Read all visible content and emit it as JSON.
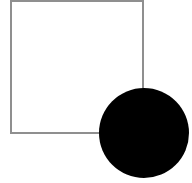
{
  "figure": {
    "name": "square-and-circle-overlap",
    "width": 192,
    "height": 183,
    "background_color": "#ffffff"
  },
  "shapes": {
    "square": {
      "label": "square",
      "x": 11,
      "y": 1,
      "width": 132,
      "height": 132,
      "stroke_color": "#8f8f8f",
      "stroke_width": 1.5,
      "fill": "none",
      "z_order": 1
    },
    "circle": {
      "label": "circle",
      "cx": 144,
      "cy": 133,
      "r": 45,
      "fill_color": "#000000",
      "stroke": "none",
      "z_order": 2
    }
  },
  "colors": {
    "outline_gray": "#8f8f8f",
    "fill_black": "#000000",
    "canvas_white": "#ffffff"
  }
}
